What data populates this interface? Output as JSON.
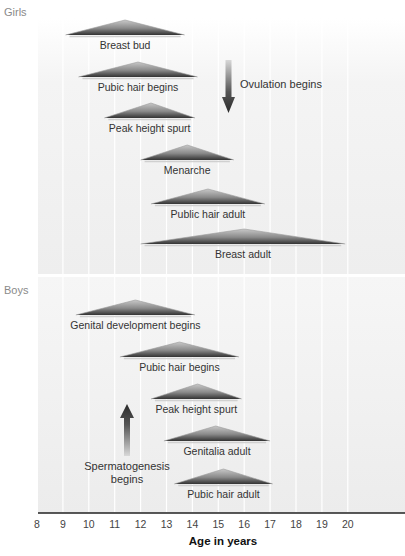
{
  "chart_data": {
    "type": "timeline",
    "title": "",
    "xlabel": "Age in years",
    "ylabel": "",
    "xlim": [
      8,
      20
    ],
    "x_ticks": [
      8,
      9,
      10,
      11,
      12,
      13,
      14,
      15,
      16,
      17,
      18,
      19,
      20
    ],
    "grid": "vertical lines at each year",
    "groups": [
      {
        "name": "Girls",
        "events": [
          {
            "label": "Breast bud",
            "start": 9.1,
            "peak": 11.4,
            "end": 13.7
          },
          {
            "label": "Pubic hair begins",
            "start": 9.6,
            "peak": 11.9,
            "end": 14.2
          },
          {
            "label": "Peak height spurt",
            "start": 10.6,
            "peak": 12.4,
            "end": 14.1
          },
          {
            "label": "Menarche",
            "start": 12.0,
            "peak": 13.8,
            "end": 15.6
          },
          {
            "label": "Public hair adult",
            "start": 12.4,
            "peak": 14.6,
            "end": 16.8
          },
          {
            "label": "Breast adult",
            "start": 12.0,
            "peak": 16.0,
            "end": 19.9
          }
        ],
        "annotations": [
          {
            "label": "Ovulation begins",
            "type": "arrow-down",
            "age": 15.4
          }
        ]
      },
      {
        "name": "Boys",
        "events": [
          {
            "label": "Genital development begins",
            "start": 9.5,
            "peak": 11.8,
            "end": 14.1
          },
          {
            "label": "Pubic hair begins",
            "start": 11.2,
            "peak": 13.5,
            "end": 15.8
          },
          {
            "label": "Peak height spurt",
            "start": 12.4,
            "peak": 14.2,
            "end": 15.9
          },
          {
            "label": "Genitalia adult",
            "start": 12.9,
            "peak": 14.9,
            "end": 17.0
          },
          {
            "label": "Pubic hair adult",
            "start": 13.3,
            "peak": 15.2,
            "end": 17.1
          }
        ],
        "annotations": [
          {
            "label": "Spermatogenesis begins",
            "type": "arrow-up",
            "age": 11.4
          }
        ]
      }
    ]
  },
  "layout": {
    "x0_px": 37,
    "px_per_year": 25.9,
    "girls_rows_y": [
      35,
      77,
      118,
      160,
      204,
      244
    ],
    "boys_rows_y": [
      315,
      357,
      399,
      441,
      484
    ],
    "triangle_height": 15
  },
  "labels": {
    "girls": "Girls",
    "boys": "Boys",
    "ovulation": "Ovulation begins",
    "spermatogenesis_line1": "Spermatogenesis",
    "spermatogenesis_line2": "begins",
    "x_axis_title": "Age in years"
  }
}
